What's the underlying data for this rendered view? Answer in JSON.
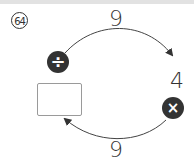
{
  "problem": {
    "number": "64",
    "top_value": "9",
    "right_value": "4",
    "bottom_value": "9",
    "top_operator": "÷",
    "bottom_operator": "×",
    "top_operator_icon": "divide-icon",
    "bottom_operator_icon": "multiply-icon",
    "answer": ""
  }
}
